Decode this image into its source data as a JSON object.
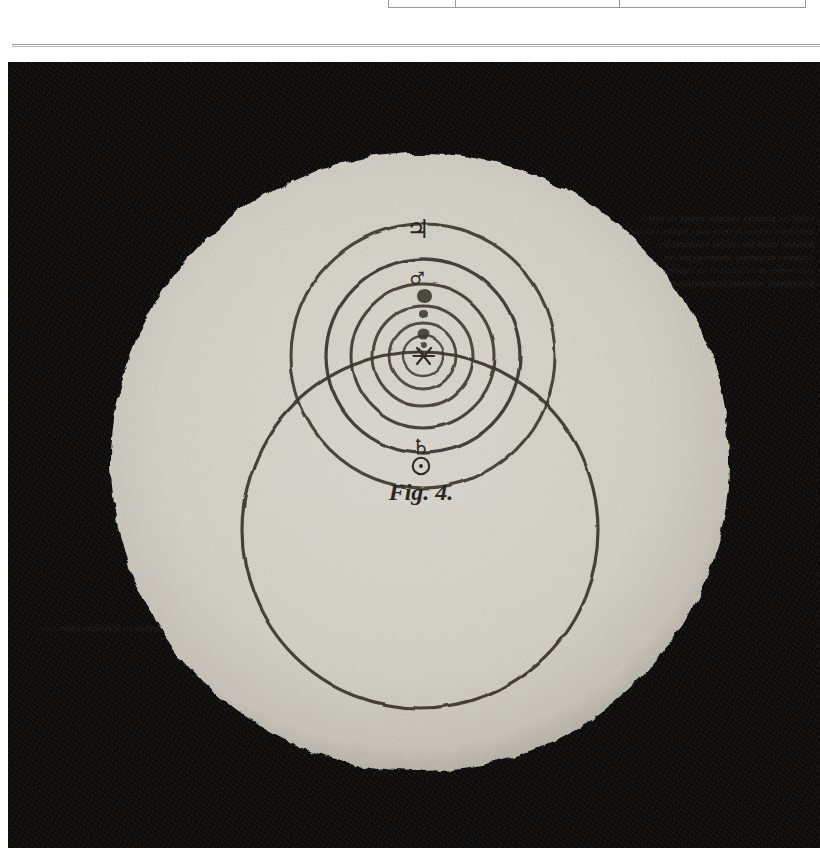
{
  "page": {
    "background_color": "#ffffff",
    "plate_background_color": "#0c0b0a",
    "paper_disc_color": "#d2cfc6",
    "ink_color": "#3a352f"
  },
  "table_fragment": {
    "name": "clipped-table-bottom-edge",
    "columns": [
      "",
      "",
      ""
    ],
    "cells": [
      "",
      "",
      ""
    ]
  },
  "rule": {
    "label": ""
  },
  "plate": {
    "title": "Fig. 4",
    "ghost_text_right": "soleil les planetes tournent autour du soleil dans leurs orbites la terre mars jupiter saturne mercure venus les cercles marquent les distances moyennes observees par les astronomes de ce siecle et les figures precedentes montrent la disposition des spheres",
    "ghost_text_left": "et ainsi la figure quatrieme represente le systeme entier avec saturne au dehors"
  },
  "figure": {
    "caption": "Fig. 4.",
    "sun_symbol": "☉",
    "sun_symbol_name": "sun-symbol",
    "center_marker": "✳",
    "bodies": [
      {
        "name": "jupiter",
        "symbol": "♃",
        "label": "Jupiter"
      },
      {
        "name": "mars",
        "symbol": "♂",
        "label": "Mars"
      },
      {
        "name": "saturn",
        "symbol": "♄",
        "label": "Saturn"
      }
    ],
    "orbit_count": 6,
    "orbits": [
      {
        "name": "orbit-jupiter",
        "cx": 415,
        "cy": 294,
        "r": 132,
        "stroke": 3.0
      },
      {
        "name": "orbit-mars",
        "cx": 415,
        "cy": 294,
        "r": 97,
        "stroke": 3.2
      },
      {
        "name": "orbit-earth",
        "cx": 415,
        "cy": 294,
        "r": 72,
        "stroke": 3.0
      },
      {
        "name": "orbit-venus",
        "cx": 415,
        "cy": 294,
        "r": 50,
        "stroke": 3.0
      },
      {
        "name": "orbit-mercury",
        "cx": 415,
        "cy": 294,
        "r": 33,
        "stroke": 2.8
      },
      {
        "name": "orbit-inner",
        "cx": 415,
        "cy": 294,
        "r": 20,
        "stroke": 2.4
      },
      {
        "name": "orbit-saturn",
        "cx": 412,
        "cy": 468,
        "r": 178,
        "stroke": 3.2
      }
    ],
    "planet_dots": [
      {
        "name": "planet-dot-large",
        "cx": 416,
        "cy": 234,
        "r": 7.0
      },
      {
        "name": "planet-dot-small",
        "cx": 415,
        "cy": 252,
        "r": 4.0
      },
      {
        "name": "planet-dot-medium",
        "cx": 415,
        "cy": 272,
        "r": 5.5
      },
      {
        "name": "planet-dot-tiny",
        "cx": 415,
        "cy": 283,
        "r": 3.0
      }
    ],
    "disc": {
      "cx": 412,
      "cy": 400,
      "r": 308
    }
  }
}
